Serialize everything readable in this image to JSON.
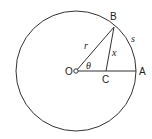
{
  "diagram": {
    "type": "geometry",
    "points": {
      "O": {
        "label": "O"
      },
      "A": {
        "label": "A"
      },
      "B": {
        "label": "B"
      },
      "C": {
        "label": "C"
      }
    },
    "labels": {
      "radius": "r",
      "perpendicular": "x",
      "arc": "s",
      "angle": "θ"
    },
    "stroke_color": "#333333"
  }
}
